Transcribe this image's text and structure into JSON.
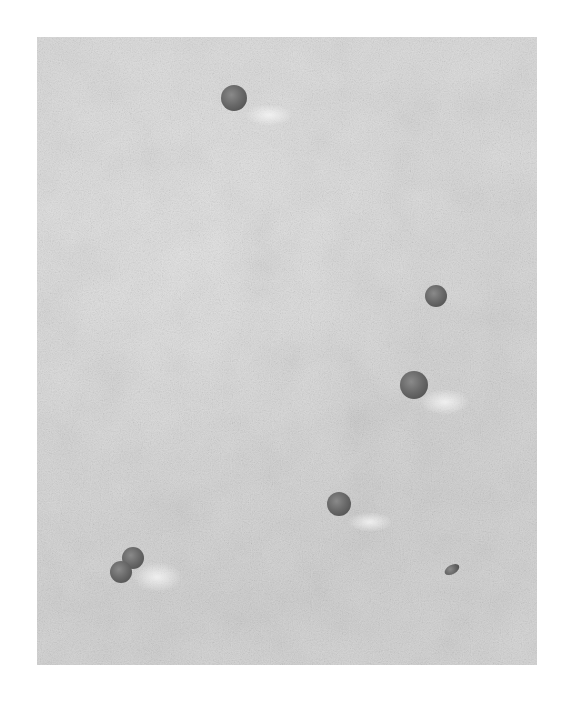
{
  "image": {
    "description": "Grayscale micrograph of spherical particles on a textured surface",
    "background_color": "#d9d9d9",
    "particle_color": "#5e5e5e",
    "particles": [
      {
        "id": "p1",
        "cx": 234,
        "cy": 98,
        "r": 13
      },
      {
        "id": "p2",
        "cx": 436,
        "cy": 296,
        "r": 11
      },
      {
        "id": "p3",
        "cx": 414,
        "cy": 385,
        "r": 14
      },
      {
        "id": "p4",
        "cx": 339,
        "cy": 504,
        "r": 12
      },
      {
        "id": "p5",
        "cx": 133,
        "cy": 558,
        "r": 11
      },
      {
        "id": "p6",
        "cx": 121,
        "cy": 572,
        "r": 11
      },
      {
        "id": "p7",
        "cx": 452,
        "cy": 570,
        "w": 16,
        "h": 9,
        "rotation": -30
      }
    ]
  }
}
